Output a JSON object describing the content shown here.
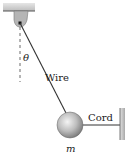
{
  "diagram": {
    "type": "physics-free-body-setup",
    "labels": {
      "angle": "θ",
      "wire": "Wire",
      "cord": "Cord",
      "mass": "m"
    },
    "colors": {
      "line": "#333333",
      "ceiling": "#d0d0d0",
      "bracket": "#a8a8a8",
      "ball_light": "#f0f0f0",
      "ball_dark": "#8a8a8a",
      "wall": "#c8c8c8"
    }
  }
}
